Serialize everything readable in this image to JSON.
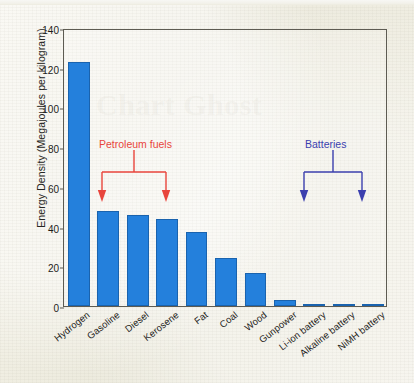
{
  "chart_data": {
    "type": "bar",
    "title": "",
    "xlabel": "",
    "ylabel": "Energy Density (Megajoules per kilogram)",
    "ylim": [
      0,
      140
    ],
    "yticks": [
      0,
      20,
      40,
      60,
      80,
      100,
      120,
      140
    ],
    "grid": false,
    "legend": "none",
    "bar_color": "#2480dc",
    "bar_edge_color": "#1a63ae",
    "categories": [
      "Hydrogen",
      "Gasoline",
      "Diesel",
      "Kerosene",
      "Fat",
      "Coal",
      "Wood",
      "Gunpower",
      "Li-ion battery",
      "Alkaline battery",
      "NiMH battery"
    ],
    "values": [
      123,
      48,
      46,
      44,
      37.5,
      24,
      16.5,
      3,
      1,
      1,
      0.5
    ],
    "annotations": [
      {
        "text": "Petroleum fuels",
        "color": "#e8453c",
        "covers": [
          "Gasoline",
          "Kerosene"
        ],
        "style": "bracket-with-arrows"
      },
      {
        "text": "Batteries",
        "color": "#3b3fae",
        "covers": [
          "Li-ion battery",
          "NiMH battery"
        ],
        "style": "bracket-with-arrows"
      }
    ]
  },
  "page": {
    "background_color": "#eeece0",
    "bleed_through_text": "Chart Ghost"
  },
  "axis": {
    "y_title": "Energy Density (Megajoules per kilogram)",
    "y_tick_labels": [
      "0",
      "20",
      "40",
      "60",
      "80",
      "100",
      "120",
      "140"
    ]
  }
}
